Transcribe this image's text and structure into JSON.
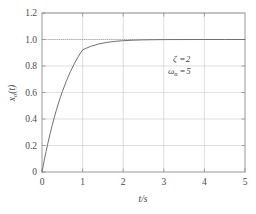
{
  "chart_data": {
    "type": "line",
    "title": "",
    "xlabel": "t/s",
    "ylabel": "x₀(t)",
    "xlim": [
      0,
      5
    ],
    "ylim": [
      0,
      1.2
    ],
    "grid": true,
    "legend": "none",
    "x_ticks": [
      "0",
      "1",
      "2",
      "3",
      "4",
      "5"
    ],
    "x_tick_values": [
      0,
      1,
      2,
      3,
      4,
      5
    ],
    "y_ticks": [
      "0",
      "0.2",
      "0.4",
      "0.6",
      "0.8",
      "1.0",
      "1.2"
    ],
    "y_tick_values": [
      0,
      0.2,
      0.4,
      0.6,
      0.8,
      1.0,
      1.2
    ],
    "reference_line": {
      "y": 1.0,
      "style": "dotted"
    },
    "annotations": [
      {
        "id": "zeta",
        "symbol": "ζ",
        "subscript": "",
        "relation": "=",
        "value": "2",
        "text": "ζ =2",
        "x": 3.3,
        "y": 0.92
      },
      {
        "id": "omega-n",
        "symbol": "ω",
        "subscript": "n",
        "relation": "=",
        "value": "5",
        "text": "ωn =5",
        "x": 3.2,
        "y": 0.84
      }
    ],
    "series": [
      {
        "name": "overdamped step response",
        "damping_ratio": 2,
        "natural_frequency": 5,
        "color": "#707070",
        "x": [
          0,
          0.05,
          0.1,
          0.15,
          0.2,
          0.25,
          0.3,
          0.35,
          0.4,
          0.45,
          0.5,
          0.6,
          0.7,
          0.8,
          0.9,
          1.0,
          1.2,
          1.4,
          1.6,
          1.8,
          2.0,
          2.25,
          2.5,
          2.75,
          3.0,
          3.25,
          3.5,
          3.75,
          4.0,
          4.5,
          5.0
        ],
        "y": [
          0,
          0.0795,
          0.1541,
          0.2241,
          0.2897,
          0.3512,
          0.4089,
          0.463,
          0.5137,
          0.5613,
          0.6059,
          0.6868,
          0.7577,
          0.8199,
          0.8744,
          0.9222,
          0.9485,
          0.9665,
          0.9784,
          0.9861,
          0.9911,
          0.9949,
          0.9971,
          0.9983,
          0.9991,
          0.9995,
          0.9997,
          0.9998,
          0.9999,
          1.0,
          1.0
        ]
      }
    ]
  },
  "axes": {
    "y_axis_label": "x₀(t)",
    "y_axis_base": "x",
    "y_axis_sub": "o",
    "y_axis_tail": "(t)",
    "x_axis_label": "t/s",
    "x_axis_numerator": "t",
    "x_axis_denominator": "s"
  },
  "colors": {
    "curve": "#707070",
    "frame": "#8d8d8d",
    "grid": "#c9c9c9",
    "reference": "#9a9a9a",
    "background": "#ffffff",
    "text": "#3f3f3f"
  }
}
